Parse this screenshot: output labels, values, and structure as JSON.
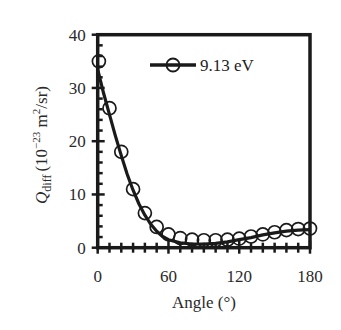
{
  "chart_data": {
    "type": "line",
    "title": "",
    "xlabel": "Angle (°)",
    "ylabel": "Q_diff (10^-23 m^2/sr)",
    "ylabel_parts": {
      "main": "Q",
      "sub": "diff",
      "unit_pre": "(10",
      "sup1": "−23",
      "unit_mid": " m",
      "sup2": "2",
      "unit_post": "/sr)"
    },
    "xlim": [
      0,
      180
    ],
    "ylim": [
      0,
      40
    ],
    "xticks": [
      0,
      60,
      120,
      180
    ],
    "yticks": [
      0,
      10,
      20,
      30,
      40
    ],
    "x_minor_step": 10,
    "y_minor_step": 2,
    "grid": false,
    "legend_position": "upper center",
    "series": [
      {
        "name": "9.13 eV",
        "marker": "open-circle",
        "color": "#1a1a1a",
        "points": {
          "x": [
            1,
            10,
            20,
            30,
            40,
            50,
            60,
            70,
            80,
            90,
            100,
            110,
            120,
            130,
            140,
            150,
            160,
            170,
            180
          ],
          "y": [
            35.0,
            26.2,
            18.0,
            11.0,
            6.5,
            3.9,
            2.5,
            1.8,
            1.5,
            1.4,
            1.4,
            1.5,
            1.7,
            2.1,
            2.5,
            2.9,
            3.3,
            3.5,
            3.6
          ]
        },
        "fit": {
          "x": [
            0,
            5,
            10,
            15,
            20,
            25,
            30,
            35,
            40,
            45,
            50,
            55,
            60,
            70,
            80,
            90,
            100,
            110,
            120,
            130,
            140,
            150,
            160,
            170,
            180
          ],
          "y": [
            33.5,
            29.0,
            25.0,
            21.0,
            17.3,
            13.8,
            10.8,
            8.2,
            6.1,
            4.4,
            3.1,
            2.1,
            1.5,
            0.9,
            0.7,
            0.7,
            0.8,
            1.1,
            1.5,
            1.9,
            2.4,
            2.8,
            3.1,
            3.3,
            3.4
          ]
        }
      }
    ]
  }
}
